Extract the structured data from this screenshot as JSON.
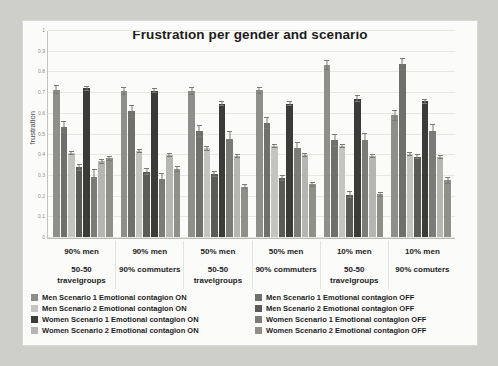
{
  "chart_data": {
    "type": "bar",
    "title": "Frustration per gender and scenario",
    "xlabel": "",
    "ylabel": "frustration",
    "ylim": [
      0,
      1
    ],
    "ytick_labels": [
      "0",
      "0.1",
      "0.2",
      "0.3",
      "0.4",
      "0.5",
      "0.6",
      "0.7",
      "0.8",
      "0.9",
      "1"
    ],
    "ytick_values": [
      0,
      0.1,
      0.2,
      0.3,
      0.4,
      0.5,
      0.6,
      0.7,
      0.8,
      0.9,
      1
    ],
    "grid": true,
    "legend_position": "bottom",
    "categories": [
      {
        "line1": "90% men",
        "line2": "50-50\ntravelgroups"
      },
      {
        "line1": "90% men",
        "line2": "90% commuters"
      },
      {
        "line1": "50% men",
        "line2": "50-50\ntravelgroups"
      },
      {
        "line1": "50% men",
        "line2": "90% commuters"
      },
      {
        "line1": "10% men",
        "line2": "50-50\ntravelgroups"
      },
      {
        "line1": "10% men",
        "line2": "90% comuters"
      }
    ],
    "category_labels": [
      "90% men 50-50 travelgroups",
      "90% men 90% commuters",
      "50% men 50-50 travelgroups",
      "50% men 90% commuters",
      "10% men 50-50 travelgroups",
      "10% men 90% comuters"
    ],
    "series": [
      {
        "name": "Men Scenario 1 Emotional contagion ON",
        "color": "#8e8e8a",
        "values": [
          0.715,
          0.71,
          0.71,
          0.712,
          0.835,
          0.59
        ],
        "errors": [
          0.022,
          0.018,
          0.018,
          0.018,
          0.022,
          0.028
        ]
      },
      {
        "name": "Men Scenario 1 Emotional contagion OFF",
        "color": "#6f6f6b",
        "values": [
          0.535,
          0.61,
          0.515,
          0.555,
          0.47,
          0.84
        ],
        "errors": [
          0.03,
          0.032,
          0.03,
          0.028,
          0.032,
          0.03
        ]
      },
      {
        "name": "Men Scenario 2 Emotional contagion ON",
        "color": "#c3c3bf",
        "values": [
          0.408,
          0.418,
          0.43,
          0.443,
          0.443,
          0.403
        ],
        "errors": [
          0.01,
          0.01,
          0.01,
          0.01,
          0.01,
          0.012
        ]
      },
      {
        "name": "Men Scenario 2 Emotional contagion OFF",
        "color": "#5a5a57",
        "values": [
          0.338,
          0.318,
          0.305,
          0.288,
          0.205,
          0.39
        ],
        "errors": [
          0.016,
          0.016,
          0.014,
          0.014,
          0.016,
          0.012
        ]
      },
      {
        "name": "Women Scenario 1 Emotional contagion ON",
        "color": "#3b3b39",
        "values": [
          0.722,
          0.71,
          0.648,
          0.648,
          0.672,
          0.658
        ],
        "errors": [
          0.012,
          0.012,
          0.014,
          0.014,
          0.016,
          0.014
        ]
      },
      {
        "name": "Women Scenario 1 Emotional contagion OFF",
        "color": "#7b7b77",
        "values": [
          0.29,
          0.282,
          0.478,
          0.432,
          0.47,
          0.515
        ],
        "errors": [
          0.038,
          0.03,
          0.034,
          0.03,
          0.034,
          0.032
        ]
      },
      {
        "name": "Women Scenario 2 Emotional contagion ON",
        "color": "#b5b5b1",
        "values": [
          0.368,
          0.398,
          0.392,
          0.398,
          0.392,
          0.39
        ],
        "errors": [
          0.012,
          0.01,
          0.01,
          0.01,
          0.01,
          0.01
        ]
      },
      {
        "name": "Women Scenario 2 Emotional contagion OFF",
        "color": "#909089",
        "values": [
          0.382,
          0.33,
          0.245,
          0.255,
          0.207,
          0.275
        ],
        "errors": [
          0.012,
          0.016,
          0.012,
          0.014,
          0.012,
          0.016
        ]
      }
    ]
  },
  "legend": {
    "left_column": [
      {
        "label": "Men Scenario 1 Emotional contagion ON",
        "color": "#8e8e8a"
      },
      {
        "label": "Men Scenario 2 Emotional contagion ON",
        "color": "#c3c3bf"
      },
      {
        "label": "Women Scenario 1 Emotional contagion ON",
        "color": "#3b3b39"
      },
      {
        "label": "Women Scenario 2 Emotional contagion ON",
        "color": "#b5b5b1"
      }
    ],
    "right_column": [
      {
        "label": "Men Scenario 1 Emotional contagion OFF",
        "color": "#6f6f6b"
      },
      {
        "label": "Men Scenario 2 Emotional contagion OFF",
        "color": "#5a5a57"
      },
      {
        "label": "Women Scenario 1 Emotional contagion OFF",
        "color": "#7b7b77"
      },
      {
        "label": "Women Scenario 2 Emotional contagion OFF",
        "color": "#909089"
      }
    ]
  }
}
